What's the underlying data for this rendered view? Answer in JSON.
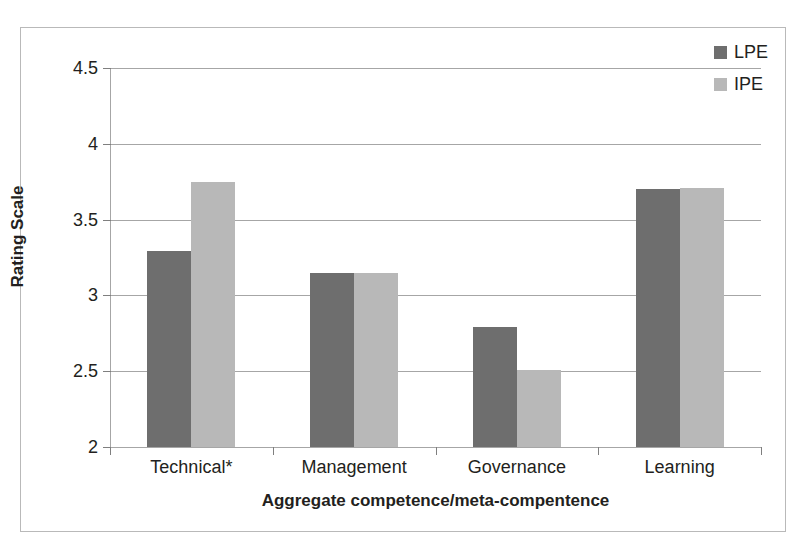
{
  "chart_data": {
    "type": "bar",
    "title": "",
    "xlabel": "Aggregate competence/meta-compentence",
    "ylabel": "Rating Scale",
    "categories": [
      "Technical*",
      "Management",
      "Governance",
      "Learning"
    ],
    "series": [
      {
        "name": "LPE",
        "color": "#6e6e6e",
        "values": [
          3.29,
          3.15,
          2.79,
          3.7
        ]
      },
      {
        "name": "IPE",
        "color": "#b8b8b8",
        "values": [
          3.75,
          3.15,
          2.51,
          3.71
        ]
      }
    ],
    "ylim": [
      2,
      4.5
    ],
    "yticks": [
      2,
      2.5,
      3,
      3.5,
      4,
      4.5
    ],
    "ytick_labels": [
      "2",
      "2.5",
      "3",
      "3.5",
      "4",
      "4.5"
    ],
    "grid": "horizontal",
    "legend_position": "top-right",
    "annotations": [
      "* indicates significant difference for Technical"
    ]
  },
  "axis": {
    "y_title": "Rating Scale",
    "x_title": "Aggregate competence/meta-compentence",
    "ytick_0": "2",
    "ytick_1": "2.5",
    "ytick_2": "3",
    "ytick_3": "3.5",
    "ytick_4": "4",
    "ytick_5": "4.5",
    "xtick_0": "Technical*",
    "xtick_1": "Management",
    "xtick_2": "Governance",
    "xtick_3": "Learning"
  },
  "legend": {
    "items": [
      {
        "label": "LPE",
        "color": "#6e6e6e"
      },
      {
        "label": "IPE",
        "color": "#b8b8b8"
      }
    ]
  }
}
